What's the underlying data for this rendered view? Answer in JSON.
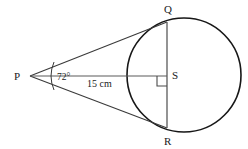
{
  "diagram": {
    "background_color": "#ffffff",
    "stroke_color": "#2b2b2b",
    "labels": {
      "point_p": "P",
      "point_q": "Q",
      "point_r": "R",
      "point_s": "S",
      "angle": "72°",
      "distance": "15 cm"
    },
    "geometry": {
      "circle": {
        "cx": 184,
        "cy": 75,
        "r": 57
      },
      "point_p": {
        "x": 30,
        "y": 76
      },
      "point_q": {
        "x": 167,
        "y": 22
      },
      "point_r": {
        "x": 167,
        "y": 128
      },
      "point_s": {
        "x": 167,
        "y": 76
      },
      "angle_degrees": 72,
      "distance_value": 15,
      "distance_unit": "cm"
    },
    "elements": [
      "circle",
      "tangent-pq",
      "tangent-pr",
      "chord-qr",
      "segment-ps",
      "angle-arc-at-p",
      "right-angle-at-s"
    ]
  }
}
